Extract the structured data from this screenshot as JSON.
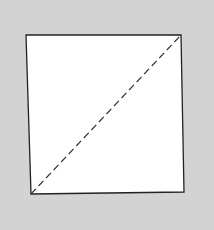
{
  "diagram": {
    "background_color": "#d3d3d3",
    "square": {
      "fill": "#ffffff",
      "stroke": "#222222",
      "stroke_width": 1.3,
      "corners": {
        "top_left": [
          26,
          35
        ],
        "top_right": [
          181,
          35
        ],
        "bottom_right": [
          184,
          192
        ],
        "bottom_left": [
          31,
          194
        ]
      }
    },
    "diagonal": {
      "style": "dashed",
      "stroke": "#333333",
      "stroke_width": 1.2,
      "dash": "7 4",
      "from": "bottom_left",
      "to": "top_right"
    }
  }
}
